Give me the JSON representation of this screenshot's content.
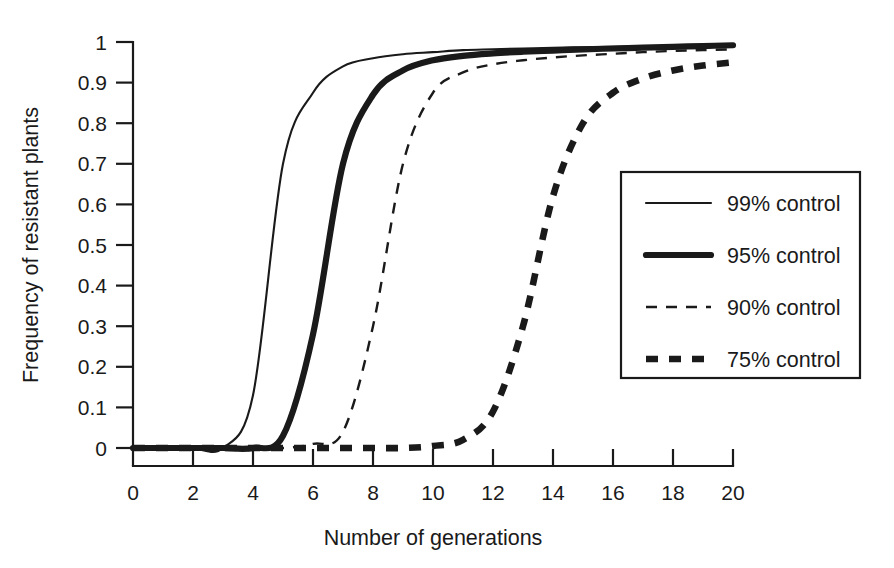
{
  "chart_data": {
    "type": "line",
    "title": "",
    "xlabel": "Number of generations",
    "ylabel": "Frequency of resistant plants",
    "xlim": [
      0,
      20
    ],
    "ylim": [
      0,
      1
    ],
    "grid": false,
    "legend_position": "right-middle",
    "xticks": [
      0,
      2,
      4,
      6,
      8,
      10,
      12,
      14,
      16,
      18,
      20
    ],
    "xtick_labels": [
      "0",
      "2",
      "4",
      "6",
      "8",
      "10",
      "12",
      "14",
      "16",
      "18",
      "20"
    ],
    "yticks": [
      0,
      0.1,
      0.2,
      0.3,
      0.4,
      0.5,
      0.6,
      0.7,
      0.8,
      0.9,
      1
    ],
    "ytick_labels": [
      "0",
      "0.1",
      "0.2",
      "0.3",
      "0.4",
      "0.5",
      "0.6",
      "0.7",
      "0.8",
      "0.9",
      "1"
    ],
    "x": [
      0,
      1,
      2,
      3,
      4,
      5,
      6,
      7,
      8,
      9,
      10,
      11,
      12,
      13,
      14,
      15,
      16,
      17,
      18,
      19,
      20
    ],
    "series": [
      {
        "name": "99% control",
        "style": "thin-solid",
        "values": [
          0.0,
          0.0,
          0.0,
          0.0,
          0.13,
          0.7,
          0.875,
          0.94,
          0.96,
          0.97,
          0.975,
          0.98,
          0.982,
          0.984,
          0.986,
          0.987,
          0.988,
          0.989,
          0.99,
          0.991,
          0.992
        ]
      },
      {
        "name": "95% control",
        "style": "thick-solid",
        "values": [
          0.0,
          0.0,
          0.0,
          0.0,
          0.0,
          0.03,
          0.28,
          0.7,
          0.87,
          0.93,
          0.955,
          0.966,
          0.972,
          0.976,
          0.979,
          0.982,
          0.984,
          0.986,
          0.988,
          0.99,
          0.992
        ]
      },
      {
        "name": "90% control",
        "style": "thin-dash",
        "values": [
          0.0,
          0.0,
          0.0,
          0.0,
          0.0,
          0.0,
          0.01,
          0.04,
          0.3,
          0.7,
          0.875,
          0.925,
          0.945,
          0.955,
          0.962,
          0.967,
          0.971,
          0.975,
          0.978,
          0.98,
          0.982
        ]
      },
      {
        "name": "75% control",
        "style": "thick-dash",
        "values": [
          0.0,
          0.0,
          0.0,
          0.0,
          0.0,
          0.0,
          0.0,
          0.0,
          0.0,
          0.0,
          0.005,
          0.02,
          0.09,
          0.3,
          0.62,
          0.8,
          0.875,
          0.91,
          0.93,
          0.942,
          0.95
        ]
      }
    ],
    "legend_entries": [
      {
        "label": "99% control",
        "style": "thin-solid"
      },
      {
        "label": "95% control",
        "style": "thick-solid"
      },
      {
        "label": "90% control",
        "style": "thin-dash"
      },
      {
        "label": "75% control",
        "style": "thick-dash"
      }
    ]
  }
}
